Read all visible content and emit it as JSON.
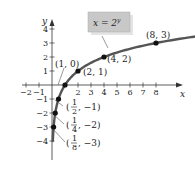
{
  "chart_data": {
    "type": "line",
    "title": "",
    "equation_label": "x = 2^y",
    "equation_display": {
      "base": "x = 2",
      "exp": "y"
    },
    "xlabel": "x",
    "ylabel": "y",
    "xlim": [
      -2,
      8
    ],
    "ylim": [
      -4,
      4
    ],
    "x_ticks": [
      -2,
      -1,
      2,
      3,
      4,
      5,
      6,
      7,
      8
    ],
    "y_ticks": [
      4,
      3,
      2,
      1,
      -1,
      -2,
      -3,
      -4
    ],
    "grid": false,
    "points": [
      {
        "x": 0.125,
        "y": -3,
        "label": "(1/8, -3)"
      },
      {
        "x": 0.25,
        "y": -2,
        "label": "(1/4, -2)"
      },
      {
        "x": 0.5,
        "y": -1,
        "label": "(1/2, -1)"
      },
      {
        "x": 1,
        "y": 0,
        "label": "(1, 0)"
      },
      {
        "x": 2,
        "y": 1,
        "label": "(2, 1)"
      },
      {
        "x": 4,
        "y": 2,
        "label": "(4, 2)"
      },
      {
        "x": 8,
        "y": 3,
        "label": "(8, 3)"
      }
    ],
    "colors": {
      "curve": "#555555",
      "point": "#111111",
      "label_box": "#c8c8c8"
    }
  }
}
